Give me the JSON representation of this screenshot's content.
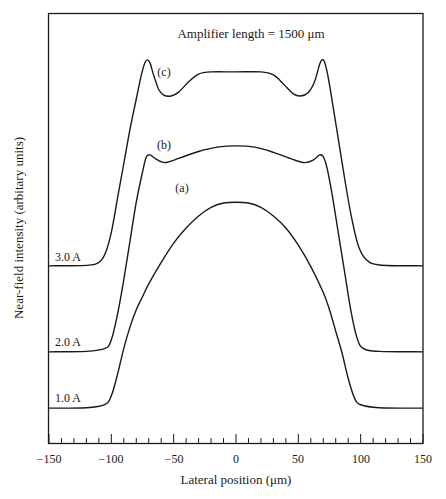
{
  "chart_data": {
    "type": "line",
    "title": "Amplifier length = 1500 μm",
    "xlabel": "Lateral position (μm)",
    "ylabel": "Near-field intensity (arbitary units)",
    "xlim": [
      -150,
      150
    ],
    "xticks": [
      -150,
      -100,
      -50,
      0,
      50,
      100,
      150
    ],
    "ylim": [
      0,
      100
    ],
    "grid": false,
    "legend": "none (curves labeled inline)",
    "series": [
      {
        "name": "(a)",
        "current_label": "1.0 A",
        "baseline": 8.1,
        "points": [
          [
            -150,
            8.1
          ],
          [
            -120,
            8.2
          ],
          [
            -105,
            9.0
          ],
          [
            -100,
            11
          ],
          [
            -95,
            16
          ],
          [
            -90,
            22
          ],
          [
            -85,
            27
          ],
          [
            -80,
            31
          ],
          [
            -75,
            34
          ],
          [
            -70,
            37
          ],
          [
            -60,
            42
          ],
          [
            -50,
            46.5
          ],
          [
            -40,
            50
          ],
          [
            -30,
            52.8
          ],
          [
            -20,
            54.8
          ],
          [
            -10,
            55.8
          ],
          [
            0,
            56.0
          ],
          [
            10,
            55.8
          ],
          [
            20,
            54.8
          ],
          [
            30,
            52.8
          ],
          [
            40,
            50
          ],
          [
            50,
            46
          ],
          [
            60,
            41
          ],
          [
            70,
            35
          ],
          [
            75,
            31
          ],
          [
            80,
            26
          ],
          [
            85,
            21
          ],
          [
            90,
            15
          ],
          [
            95,
            10.5
          ],
          [
            100,
            8.9
          ],
          [
            115,
            8.2
          ],
          [
            150,
            8.1
          ]
        ]
      },
      {
        "name": "(b)",
        "current_label": "2.0 A",
        "baseline": 21.2,
        "points": [
          [
            -150,
            21.2
          ],
          [
            -120,
            21.3
          ],
          [
            -105,
            22
          ],
          [
            -100,
            24
          ],
          [
            -95,
            30
          ],
          [
            -90,
            38
          ],
          [
            -85,
            47
          ],
          [
            -80,
            56
          ],
          [
            -75,
            63
          ],
          [
            -72,
            66.5
          ],
          [
            -69,
            67.0
          ],
          [
            -65,
            66.2
          ],
          [
            -60,
            65.4
          ],
          [
            -55,
            65.3
          ],
          [
            -45,
            66.3
          ],
          [
            -30,
            67.8
          ],
          [
            -15,
            68.8
          ],
          [
            0,
            69.1
          ],
          [
            15,
            68.8
          ],
          [
            30,
            67.6
          ],
          [
            45,
            66
          ],
          [
            55,
            65.2
          ],
          [
            62,
            65.8
          ],
          [
            67,
            67.0
          ],
          [
            70,
            66.6
          ],
          [
            73,
            64
          ],
          [
            77,
            58
          ],
          [
            82,
            49
          ],
          [
            87,
            40
          ],
          [
            92,
            31
          ],
          [
            97,
            24.5
          ],
          [
            102,
            22
          ],
          [
            115,
            21.3
          ],
          [
            150,
            21.2
          ]
        ]
      },
      {
        "name": "(c)",
        "current_label": "3.0 A",
        "baseline": 41.2,
        "points": [
          [
            -150,
            41.2
          ],
          [
            -120,
            41.3
          ],
          [
            -110,
            42
          ],
          [
            -105,
            44
          ],
          [
            -100,
            49
          ],
          [
            -95,
            57
          ],
          [
            -90,
            65
          ],
          [
            -85,
            73
          ],
          [
            -80,
            80
          ],
          [
            -76,
            85.5
          ],
          [
            -73,
            88.5
          ],
          [
            -71,
            89.1
          ],
          [
            -69,
            88.4
          ],
          [
            -66,
            85.5
          ],
          [
            -62,
            82.2
          ],
          [
            -58,
            80.9
          ],
          [
            -52,
            80.7
          ],
          [
            -46,
            81.6
          ],
          [
            -38,
            84
          ],
          [
            -30,
            85.8
          ],
          [
            -20,
            86.3
          ],
          [
            0,
            86.3
          ],
          [
            20,
            86.3
          ],
          [
            30,
            85.6
          ],
          [
            38,
            83.5
          ],
          [
            46,
            81.2
          ],
          [
            52,
            80.7
          ],
          [
            58,
            81.5
          ],
          [
            63,
            84
          ],
          [
            67,
            88
          ],
          [
            69,
            89.1
          ],
          [
            71,
            88.6
          ],
          [
            74,
            85
          ],
          [
            78,
            78
          ],
          [
            83,
            69
          ],
          [
            88,
            60
          ],
          [
            93,
            52
          ],
          [
            98,
            46
          ],
          [
            104,
            42.8
          ],
          [
            115,
            41.4
          ],
          [
            150,
            41.2
          ]
        ]
      }
    ],
    "annotations": [
      {
        "text": "(c)",
        "x": -52,
        "y": 85
      },
      {
        "text": "(b)",
        "x": -52,
        "y": 67.5
      },
      {
        "text": "(a)",
        "x": -38,
        "y": 59
      },
      {
        "text": "3.0 A",
        "x": -145,
        "y": 43.5
      },
      {
        "text": "2.0 A",
        "x": -145,
        "y": 23.5
      },
      {
        "text": "1.0 A",
        "x": -145,
        "y": 10.5
      }
    ]
  },
  "labels": {
    "title": "Amplifier length = 1500 μm",
    "xlabel": "Lateral position (μm)",
    "ylabel": "Near-field intensity (arbitary units)",
    "xticks": [
      "−150",
      "−100",
      "−50",
      "0",
      "50",
      "100",
      "150"
    ],
    "curve_a": "(a)",
    "curve_b": "(b)",
    "curve_c": "(c)",
    "current_3": "3.0 A",
    "current_2": "2.0 A",
    "current_1": "1.0 A"
  },
  "colors": {
    "line": "#1a1a1a",
    "background": "#ffffff"
  }
}
